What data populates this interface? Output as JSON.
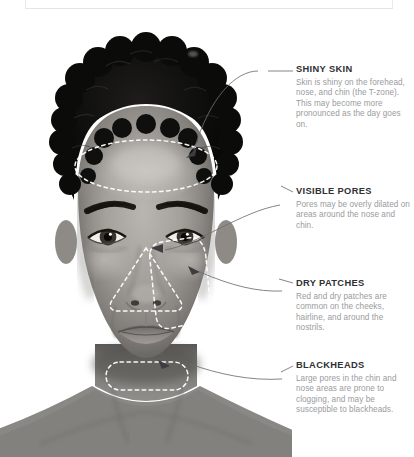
{
  "page": {
    "type": "skin-type-infographic",
    "background_color": "#ffffff",
    "photo": {
      "description": "grayscale front-facing portrait of a woman with short curly hair",
      "is_grayscale": true
    }
  },
  "annotations": [
    {
      "id": "shiny-skin",
      "title": "SHINY SKIN",
      "body": "Skin is shiny on the forehead, nose, and chin (the T-zone). This may become more pronounced as the day goes on.",
      "target_region": "forehead"
    },
    {
      "id": "visible-pores",
      "title": "VISIBLE PORES",
      "body": "Pores may be overly dilated on areas around the nose and chin.",
      "target_region": "nose"
    },
    {
      "id": "dry-patches",
      "title": "DRY PATCHES",
      "body": "Red and dry patches are common on the cheeks, hairline, and around the nostrils.",
      "target_region": "cheek"
    },
    {
      "id": "blackheads",
      "title": "BLACKHEADS",
      "body": "Large pores in the chin and nose areas are prone to clogging, and may be susceptible to blackheads.",
      "target_region": "chin"
    }
  ],
  "highlight_regions": [
    {
      "name": "forehead-region",
      "shape": "ellipse"
    },
    {
      "name": "nose-region",
      "shape": "triangle"
    },
    {
      "name": "cheek-region",
      "shape": "rounded-rectangle"
    },
    {
      "name": "chin-region",
      "shape": "pill"
    }
  ],
  "style": {
    "heading_color": "#2f3033",
    "body_color": "#9a9b9e",
    "dashed_outline_color": "#ffffff",
    "leader_line_color": "#6e6f72",
    "box_edge_color": "#e6e6e6"
  }
}
